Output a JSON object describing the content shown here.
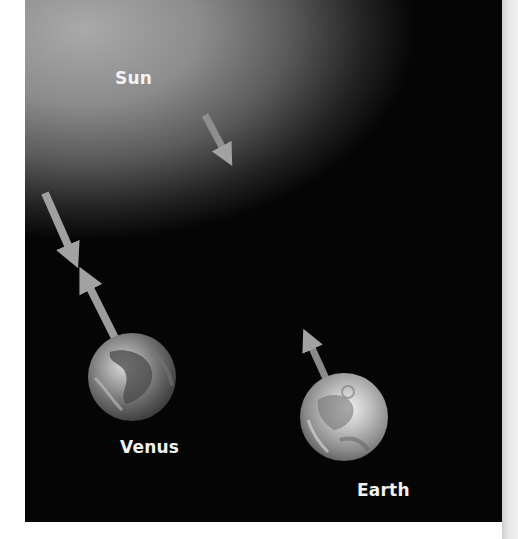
{
  "diagram": {
    "labels": {
      "sun": "Sun",
      "venus": "Venus",
      "earth": "Earth"
    },
    "colors": {
      "background": "#050505",
      "sun_glow": "#a9a9a9",
      "arrow": "#9a9a9a",
      "label_text": "#f2f2f2"
    },
    "arrows": [
      {
        "name": "sunlight-arrow-top",
        "from": [
          205,
          115
        ],
        "to": [
          230,
          162
        ]
      },
      {
        "name": "sunlight-arrow-to-venus",
        "from": [
          45,
          193
        ],
        "to": [
          77,
          266
        ]
      },
      {
        "name": "venus-reflected-arrow",
        "from": [
          116,
          340
        ],
        "to": [
          80,
          268
        ]
      },
      {
        "name": "earth-reflected-arrow",
        "from": [
          327,
          382
        ],
        "to": [
          305,
          330
        ]
      }
    ]
  }
}
